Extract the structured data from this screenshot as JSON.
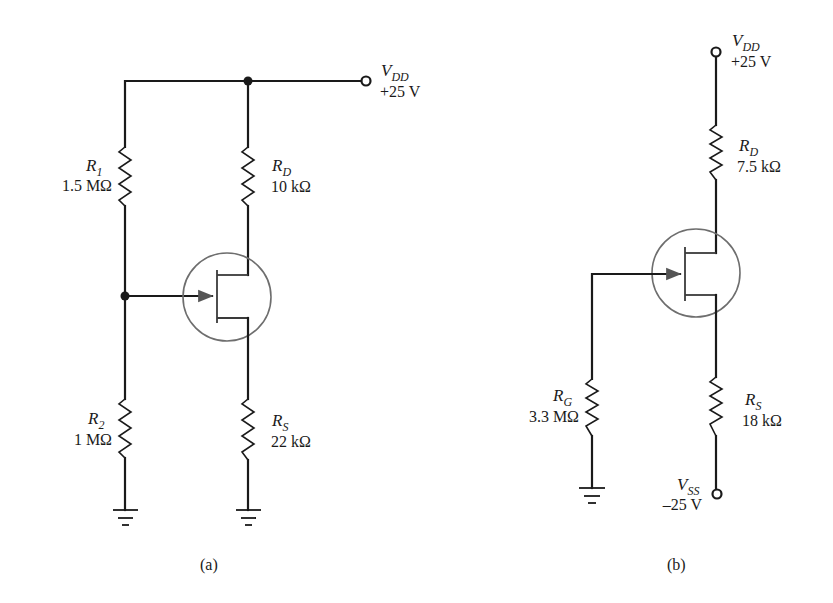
{
  "figure": {
    "caption_a": "(a)",
    "caption_b": "(b)"
  },
  "circuit_a": {
    "vdd": {
      "symbol": "V",
      "subscript": "DD",
      "value": "+25 V"
    },
    "r1": {
      "symbol": "R",
      "subscript": "1",
      "value": "1.5 MΩ"
    },
    "r2": {
      "symbol": "R",
      "subscript": "2",
      "value": "1 MΩ"
    },
    "rd": {
      "symbol": "R",
      "subscript": "D",
      "value": "10 kΩ"
    },
    "rs": {
      "symbol": "R",
      "subscript": "S",
      "value": "22 kΩ"
    },
    "transistor": "n-channel JFET"
  },
  "circuit_b": {
    "vdd": {
      "symbol": "V",
      "subscript": "DD",
      "value": "+25 V"
    },
    "vss": {
      "symbol": "V",
      "subscript": "SS",
      "value": "–25 V"
    },
    "rg": {
      "symbol": "R",
      "subscript": "G",
      "value": "3.3 MΩ"
    },
    "rd": {
      "symbol": "R",
      "subscript": "D",
      "value": "7.5 kΩ"
    },
    "rs": {
      "symbol": "R",
      "subscript": "S",
      "value": "18 kΩ"
    },
    "transistor": "n-channel JFET"
  }
}
